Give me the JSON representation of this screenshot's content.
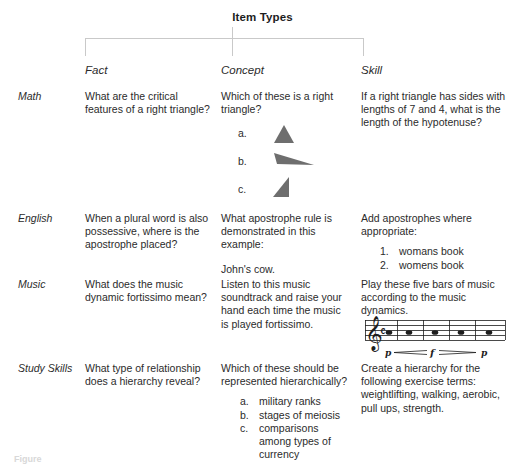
{
  "title": "Item Types",
  "columns": [
    {
      "id": "fact",
      "label": "Fact"
    },
    {
      "id": "concept",
      "label": "Concept"
    },
    {
      "id": "skill",
      "label": "Skill"
    }
  ],
  "rows": [
    {
      "id": "math",
      "label": "Math",
      "fact": {
        "text": "What are the critical features of a right triangle?"
      },
      "concept": {
        "text": "Which of these is a right triangle?",
        "options": [
          {
            "marker": "a.",
            "shape": "acute-isosceles-triangle"
          },
          {
            "marker": "b.",
            "shape": "obtuse-flat-triangle"
          },
          {
            "marker": "c.",
            "shape": "right-triangle"
          }
        ]
      },
      "skill": {
        "text": "If a right triangle has sides with lengths of 7 and 4, what is the length of the hypotenuse?"
      }
    },
    {
      "id": "english",
      "label": "English",
      "fact": {
        "text": "When a plural word is also possessive, where is the apostrophe placed?"
      },
      "concept": {
        "text": "What apostrophe rule is demonstrated in this example:",
        "example": "John's cow."
      },
      "skill": {
        "text": "Add apostrophes where appropriate:",
        "list": [
          {
            "marker": "1.",
            "text": "womans book"
          },
          {
            "marker": "2.",
            "text": "womens book"
          }
        ]
      }
    },
    {
      "id": "music",
      "label": "Music",
      "fact": {
        "text": "What does the music dynamic fortissimo mean?"
      },
      "concept": {
        "text": "Listen to this music soundtrack and raise your hand each time the music is played fortissimo."
      },
      "skill": {
        "text": "Play these five bars of music according to the music dynamics.",
        "notation": {
          "clef": "treble-clef",
          "time_signature": "common-time",
          "bars": 5,
          "notes": [
            "whole-note",
            "whole-note",
            "whole-note",
            "whole-note",
            "whole-note"
          ],
          "dynamics": [
            "p",
            "f",
            "p"
          ],
          "hairpins": [
            "crescendo",
            "diminuendo"
          ]
        }
      }
    },
    {
      "id": "studyskills",
      "label": "Study Skills",
      "fact": {
        "text": "What type of relationship does a hierarchy reveal?"
      },
      "concept": {
        "text": "Which of these should be represented hierarchically?",
        "list": [
          {
            "marker": "a.",
            "text": "military ranks"
          },
          {
            "marker": "b.",
            "text": "stages of meiosis"
          },
          {
            "marker": "c.",
            "text": "comparisons among types of currency"
          }
        ]
      },
      "skill": {
        "text": "Create a hierarchy for the following exercise terms: weightlifting, walking, aerobic, pull ups, strength."
      }
    }
  ],
  "caption": "Figure",
  "colors": {
    "text": "#2b2b2b",
    "title": "#1d1d1d",
    "connector": "#c9c9c9",
    "shape_fill": "#6e6e6e",
    "staff": "#1d1d1d",
    "page_background": "#ffffff"
  }
}
